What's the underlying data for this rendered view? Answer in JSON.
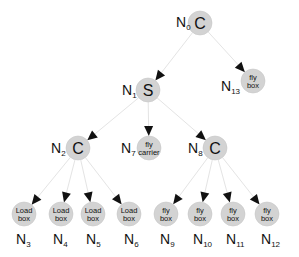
{
  "diagram": {
    "type": "tree",
    "colors": {
      "node_fill": "#d3d3d3",
      "edge": "#e4e4e4",
      "arrow": "#111111",
      "text": "#111111"
    },
    "nodes": [
      {
        "id": "N0",
        "label_main": "N",
        "label_sub": "0",
        "content": [
          "C"
        ],
        "kind": "letter",
        "x": 200,
        "y": 23
      },
      {
        "id": "N1",
        "label_main": "N",
        "label_sub": "1",
        "content": [
          "S"
        ],
        "kind": "letter",
        "x": 148,
        "y": 90
      },
      {
        "id": "N13",
        "label_main": "N",
        "label_sub": "13",
        "content": [
          "fly",
          "box"
        ],
        "kind": "action",
        "x": 253,
        "y": 81
      },
      {
        "id": "N2",
        "label_main": "N",
        "label_sub": "2",
        "content": [
          "C"
        ],
        "kind": "letter",
        "x": 78,
        "y": 148
      },
      {
        "id": "N7",
        "label_main": "N",
        "label_sub": "7",
        "content": [
          "fly",
          "carrier"
        ],
        "kind": "action",
        "x": 149,
        "y": 148
      },
      {
        "id": "N8",
        "label_main": "N",
        "label_sub": "8",
        "content": [
          "C"
        ],
        "kind": "letter",
        "x": 215,
        "y": 148
      },
      {
        "id": "N3",
        "label_main": "N",
        "label_sub": "3",
        "content": [
          "Load",
          "box"
        ],
        "kind": "action",
        "x": 24,
        "y": 214
      },
      {
        "id": "N4",
        "label_main": "N",
        "label_sub": "4",
        "content": [
          "Load",
          "box"
        ],
        "kind": "action",
        "x": 61,
        "y": 214
      },
      {
        "id": "N5",
        "label_main": "N",
        "label_sub": "5",
        "content": [
          "Load",
          "box"
        ],
        "kind": "action",
        "x": 93,
        "y": 214
      },
      {
        "id": "N6",
        "label_main": "N",
        "label_sub": "6",
        "content": [
          "Load",
          "box"
        ],
        "kind": "action",
        "x": 129,
        "y": 214
      },
      {
        "id": "N9",
        "label_main": "N",
        "label_sub": "9",
        "content": [
          "fly",
          "box"
        ],
        "kind": "action",
        "x": 166,
        "y": 214
      },
      {
        "id": "N10",
        "label_main": "N",
        "label_sub": "10",
        "content": [
          "fly",
          "box"
        ],
        "kind": "action",
        "x": 200,
        "y": 214
      },
      {
        "id": "N11",
        "label_main": "N",
        "label_sub": "11",
        "content": [
          "fly",
          "box"
        ],
        "kind": "action",
        "x": 233,
        "y": 214
      },
      {
        "id": "N12",
        "label_main": "N",
        "label_sub": "12",
        "content": [
          "fly",
          "box"
        ],
        "kind": "action",
        "x": 267,
        "y": 214
      }
    ],
    "edges": [
      {
        "from": "N0",
        "to": "N1"
      },
      {
        "from": "N0",
        "to": "N13"
      },
      {
        "from": "N1",
        "to": "N2"
      },
      {
        "from": "N1",
        "to": "N7"
      },
      {
        "from": "N1",
        "to": "N8"
      },
      {
        "from": "N2",
        "to": "N3"
      },
      {
        "from": "N2",
        "to": "N4"
      },
      {
        "from": "N2",
        "to": "N5"
      },
      {
        "from": "N2",
        "to": "N6"
      },
      {
        "from": "N8",
        "to": "N9"
      },
      {
        "from": "N8",
        "to": "N10"
      },
      {
        "from": "N8",
        "to": "N11"
      },
      {
        "from": "N8",
        "to": "N12"
      }
    ],
    "labels": {
      "N0": {
        "x": 176,
        "y": 27
      },
      "N1": {
        "x": 122,
        "y": 95
      },
      "N13": {
        "x": 221,
        "y": 91
      },
      "N2": {
        "x": 51,
        "y": 153
      },
      "N7": {
        "x": 121,
        "y": 153
      },
      "N8": {
        "x": 188,
        "y": 153
      },
      "N3": {
        "x": 16,
        "y": 244
      },
      "N4": {
        "x": 53,
        "y": 244
      },
      "N5": {
        "x": 86,
        "y": 244
      },
      "N6": {
        "x": 124,
        "y": 244
      },
      "N9": {
        "x": 160,
        "y": 244
      },
      "N10": {
        "x": 193,
        "y": 244
      },
      "N11": {
        "x": 226,
        "y": 244
      },
      "N12": {
        "x": 261,
        "y": 244
      }
    }
  }
}
